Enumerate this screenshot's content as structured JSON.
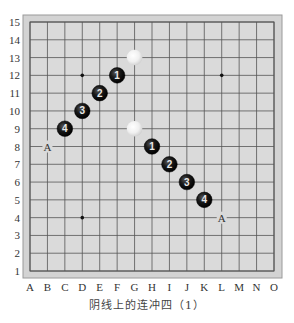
{
  "board": {
    "size": 15,
    "columns": [
      "A",
      "B",
      "C",
      "D",
      "E",
      "F",
      "G",
      "H",
      "I",
      "J",
      "K",
      "L",
      "M",
      "N",
      "O"
    ],
    "rows": [
      "15",
      "14",
      "13",
      "12",
      "11",
      "10",
      "9",
      "8",
      "7",
      "6",
      "5",
      "4",
      "3",
      "2",
      "1"
    ],
    "colors": {
      "board_fill": "#d9d9d9",
      "margin_fill": "#d2d2d2",
      "grid_line": "#555555",
      "border": "#8a8a8a",
      "black_stone": "#111111",
      "white_stone": "#f2f2f2"
    },
    "star_points": [
      "D12",
      "L12",
      "D4",
      "L4",
      "H8"
    ],
    "stones": [
      {
        "pos": "F12",
        "color": "black",
        "label": "1"
      },
      {
        "pos": "E11",
        "color": "black",
        "label": "2"
      },
      {
        "pos": "D10",
        "color": "black",
        "label": "3"
      },
      {
        "pos": "C9",
        "color": "black",
        "label": "4"
      },
      {
        "pos": "H8",
        "color": "black",
        "label": "1"
      },
      {
        "pos": "I7",
        "color": "black",
        "label": "2"
      },
      {
        "pos": "J6",
        "color": "black",
        "label": "3"
      },
      {
        "pos": "K5",
        "color": "black",
        "label": "4"
      },
      {
        "pos": "G13",
        "color": "white",
        "label": ""
      },
      {
        "pos": "G9",
        "color": "white",
        "label": ""
      }
    ],
    "markers": [
      {
        "pos": "B8",
        "label": "A"
      },
      {
        "pos": "L4",
        "label": "A"
      }
    ]
  },
  "caption": "阴线上的连冲四（1）"
}
